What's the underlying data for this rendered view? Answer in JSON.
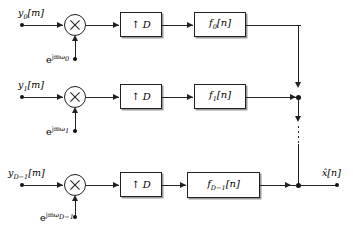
{
  "figure": {
    "kind": "block-diagram",
    "upsampler_label": "D",
    "upsampler_arrow": "↑",
    "multiply_symbol": "×",
    "output_label": "x̂[n]",
    "vertical_ellipsis": "⋮"
  },
  "branches": [
    {
      "index": "0",
      "input_label": "y",
      "input_sub": "0",
      "input_arg": "[m]",
      "modulator_base": "e",
      "modulator_exp": "jmω",
      "modulator_sub": "0",
      "upsampler": "↑ D",
      "filter_label": "f",
      "filter_sub": "0",
      "filter_arg": "[n]"
    },
    {
      "index": "1",
      "input_label": "y",
      "input_sub": "1",
      "input_arg": "[m]",
      "modulator_base": "e",
      "modulator_exp": "jmω",
      "modulator_sub": "1",
      "upsampler": "↑ D",
      "filter_label": "f",
      "filter_sub": "1",
      "filter_arg": "[n]"
    },
    {
      "index": "D-1",
      "input_label": "y",
      "input_sub": "D−1",
      "input_arg": "[m]",
      "modulator_base": "e",
      "modulator_exp": "jmω",
      "modulator_sub": "D−1",
      "upsampler": "↑ D",
      "filter_label": "f",
      "filter_sub": "D−1",
      "filter_arg": "[n]"
    }
  ],
  "colors": {
    "line": "#222222",
    "background": "#ffffff",
    "shadow": "#9a9a9a"
  }
}
